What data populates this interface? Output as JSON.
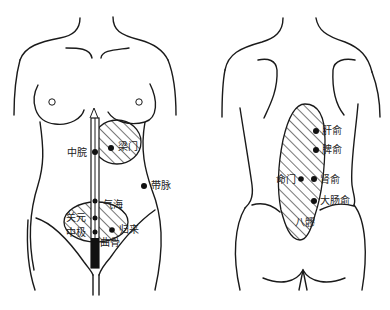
{
  "diagram": {
    "title": "",
    "front_view": {
      "name": "front torso",
      "points": [
        {
          "id": "zhongwan",
          "label": "中脘"
        },
        {
          "id": "liangmen",
          "label": "梁门"
        },
        {
          "id": "daimai",
          "label": "带脉"
        },
        {
          "id": "qihai",
          "label": "气海"
        },
        {
          "id": "guanyuan",
          "label": "关元"
        },
        {
          "id": "zhongji",
          "label": "中极"
        },
        {
          "id": "guilai",
          "label": "归来"
        },
        {
          "id": "qugu",
          "label": "曲骨"
        }
      ]
    },
    "back_view": {
      "name": "back torso",
      "points": [
        {
          "id": "ganshu",
          "label": "肝俞"
        },
        {
          "id": "pishu",
          "label": "脾俞"
        },
        {
          "id": "mingmen",
          "label": "命门"
        },
        {
          "id": "shenshu",
          "label": "肾俞"
        },
        {
          "id": "dachangshu",
          "label": "大肠俞"
        },
        {
          "id": "baliao",
          "label": "八髎"
        }
      ]
    },
    "colors": {
      "ink": "#1a1a1a",
      "background": "#ffffff"
    }
  }
}
